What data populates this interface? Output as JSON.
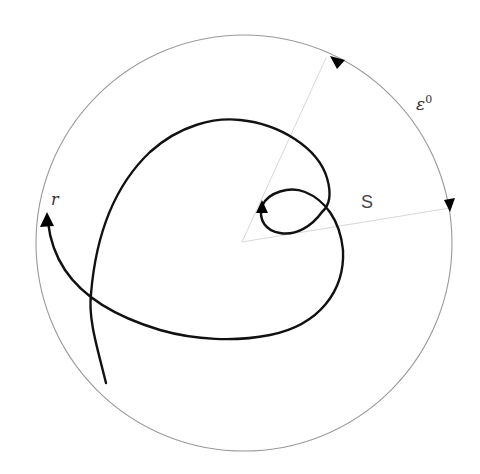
{
  "diagram": {
    "type": "spiral-in-disk",
    "labels": {
      "epsilon": "ε",
      "epsilon_sup": "0",
      "s": "S",
      "r": "r"
    },
    "colors": {
      "background": "#ffffff",
      "circle": "#9a9a9a",
      "radial_lines": "#d8d8d8",
      "curve": "#111111",
      "arrowheads": "#000000"
    },
    "circle": {
      "cx": 244,
      "cy": 243,
      "r": 208
    }
  }
}
